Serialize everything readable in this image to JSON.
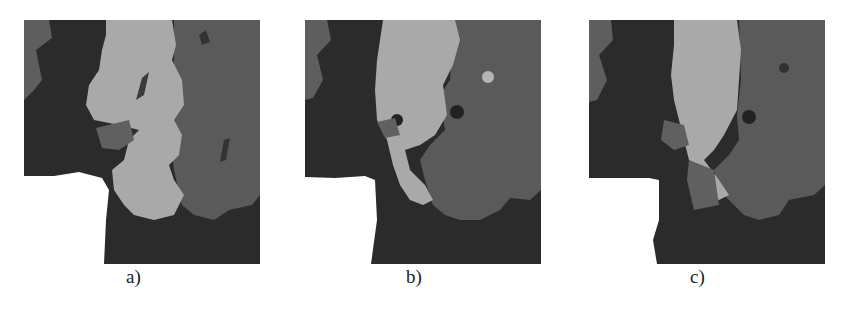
{
  "figure": {
    "panels": [
      {
        "id": "a",
        "caption": "a)"
      },
      {
        "id": "b",
        "caption": "b)"
      },
      {
        "id": "c",
        "caption": "c)"
      }
    ],
    "colors": {
      "dark": "#2a2a2a",
      "mid": "#5a5a5a",
      "mid_light": "#6e6e6e",
      "light": "#a8a8a8",
      "background": "#ffffff"
    }
  }
}
